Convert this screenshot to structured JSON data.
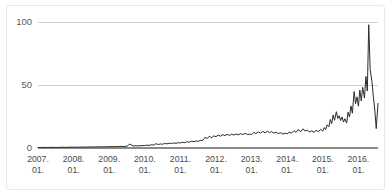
{
  "chart_data": {
    "type": "line",
    "title": "",
    "subtitle": "",
    "xlabel": "",
    "ylabel": "",
    "ylim": [
      0,
      100
    ],
    "yticks": [
      0,
      50,
      100
    ],
    "ytick_labels": [
      "0",
      "50",
      "100"
    ],
    "grid": true,
    "legend": "none",
    "xtick_labels": [
      {
        "year": "2007.",
        "month": "01."
      },
      {
        "year": "2008.",
        "month": "01."
      },
      {
        "year": "2009.",
        "month": "01."
      },
      {
        "year": "2010.",
        "month": "01."
      },
      {
        "year": "2011.",
        "month": "01."
      },
      {
        "year": "2012.",
        "month": "01."
      },
      {
        "year": "2013.",
        "month": "01."
      },
      {
        "year": "2014.",
        "month": "01."
      },
      {
        "year": "2015.",
        "month": "01."
      },
      {
        "year": "2016.",
        "month": "01."
      }
    ],
    "x_range": [
      2007.0,
      2016.55
    ],
    "series": [
      {
        "name": "Search interest",
        "color": "#2b2b2b",
        "x": [
          2007.0,
          2007.08,
          2007.17,
          2007.25,
          2007.33,
          2007.42,
          2007.5,
          2007.58,
          2007.67,
          2007.75,
          2007.83,
          2007.92,
          2008.0,
          2008.08,
          2008.17,
          2008.25,
          2008.33,
          2008.42,
          2008.5,
          2008.58,
          2008.67,
          2008.75,
          2008.83,
          2008.92,
          2009.0,
          2009.08,
          2009.17,
          2009.25,
          2009.33,
          2009.42,
          2009.5,
          2009.58,
          2009.67,
          2009.75,
          2009.83,
          2009.92,
          2010.0,
          2010.06,
          2010.12,
          2010.19,
          2010.25,
          2010.31,
          2010.38,
          2010.44,
          2010.5,
          2010.56,
          2010.62,
          2010.69,
          2010.75,
          2010.81,
          2010.88,
          2010.94,
          2011.0,
          2011.06,
          2011.12,
          2011.19,
          2011.25,
          2011.31,
          2011.38,
          2011.44,
          2011.5,
          2011.56,
          2011.62,
          2011.69,
          2011.75,
          2011.81,
          2011.88,
          2011.94,
          2012.0,
          2012.06,
          2012.12,
          2012.19,
          2012.25,
          2012.31,
          2012.38,
          2012.44,
          2012.5,
          2012.56,
          2012.62,
          2012.69,
          2012.75,
          2012.81,
          2012.88,
          2012.94,
          2013.0,
          2013.06,
          2013.12,
          2013.19,
          2013.25,
          2013.31,
          2013.38,
          2013.44,
          2013.5,
          2013.56,
          2013.62,
          2013.69,
          2013.75,
          2013.81,
          2013.88,
          2013.94,
          2014.0,
          2014.06,
          2014.12,
          2014.19,
          2014.25,
          2014.31,
          2014.38,
          2014.44,
          2014.5,
          2014.56,
          2014.62,
          2014.69,
          2014.75,
          2014.81,
          2014.88,
          2014.94,
          2015.0,
          2015.04,
          2015.08,
          2015.12,
          2015.17,
          2015.21,
          2015.25,
          2015.29,
          2015.33,
          2015.38,
          2015.42,
          2015.46,
          2015.5,
          2015.54,
          2015.58,
          2015.62,
          2015.67,
          2015.71,
          2015.75,
          2015.79,
          2015.83,
          2015.88,
          2015.92,
          2015.96,
          2016.0,
          2016.04,
          2016.08,
          2016.12,
          2016.17,
          2016.21,
          2016.25,
          2016.29,
          2016.33,
          2016.38,
          2016.42,
          2016.46,
          2016.5,
          2016.55
        ],
        "values": [
          0.4,
          0.4,
          0.5,
          0.4,
          0.5,
          0.5,
          0.4,
          0.5,
          0.6,
          0.5,
          0.6,
          0.6,
          0.7,
          0.6,
          0.7,
          0.8,
          0.7,
          0.8,
          0.9,
          0.8,
          0.9,
          1.0,
          0.9,
          1.0,
          1.1,
          1.0,
          1.2,
          1.1,
          1.3,
          1.2,
          1.4,
          3.1,
          1.6,
          1.8,
          1.7,
          1.9,
          2.0,
          2.2,
          2.1,
          2.6,
          2.3,
          3.4,
          2.8,
          3.2,
          3.0,
          3.6,
          3.3,
          3.8,
          3.5,
          4.0,
          3.7,
          4.2,
          4.0,
          4.6,
          4.2,
          5.0,
          4.6,
          5.4,
          5.0,
          5.6,
          5.2,
          6.2,
          5.8,
          8.4,
          7.6,
          9.2,
          8.2,
          9.6,
          9.0,
          10.2,
          9.4,
          10.6,
          9.8,
          10.8,
          10.0,
          11.0,
          10.2,
          11.2,
          10.4,
          11.4,
          10.6,
          11.6,
          10.8,
          11.0,
          10.6,
          12.4,
          11.4,
          12.8,
          11.8,
          13.2,
          12.0,
          13.4,
          12.2,
          13.0,
          11.8,
          12.6,
          11.4,
          12.2,
          11.0,
          11.8,
          11.2,
          12.6,
          11.8,
          13.8,
          12.4,
          14.6,
          13.0,
          15.2,
          13.6,
          14.2,
          12.8,
          13.6,
          12.4,
          14.0,
          13.0,
          14.8,
          13.4,
          16.2,
          14.6,
          18.4,
          16.8,
          22.6,
          19.4,
          26.2,
          22.0,
          28.8,
          23.4,
          25.6,
          21.8,
          24.6,
          20.6,
          23.2,
          19.8,
          28.4,
          24.6,
          33.4,
          27.6,
          44.8,
          35.2,
          40.6,
          33.2,
          46.0,
          37.4,
          48.2,
          39.6,
          56.8,
          45.2,
          97.8,
          62.4,
          52.8,
          40.6,
          30.2,
          15.4,
          35.4
        ]
      }
    ],
    "notes": {
      "peak_value": 98,
      "peak_period": "2016. 01.",
      "final_value": 35
    }
  }
}
